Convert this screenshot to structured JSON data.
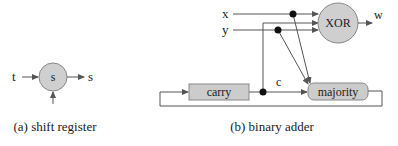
{
  "figure_a": {
    "caption": "(a) shift register",
    "node_label": "s",
    "input_label": "t",
    "output_label": "s"
  },
  "figure_b": {
    "caption": "(b) binary adder",
    "inputs": {
      "x": "x",
      "y": "y"
    },
    "xor_label": "XOR",
    "output_label": "w",
    "carry_label": "carry",
    "majority_label": "majority",
    "carry_wire_label": "c"
  },
  "colors": {
    "node_fill": "#cfcfcf",
    "box_fill": "#cccccc",
    "line": "#555555",
    "dot": "#111111"
  }
}
